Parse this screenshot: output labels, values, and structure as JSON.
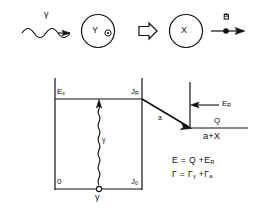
{
  "figure": {
    "title": "",
    "colors": {
      "ink": "#111111",
      "background": "#ffffff"
    }
  },
  "reaction_row": {
    "incoming_photon": {
      "icon": "wavy-arrow-right",
      "label": "γ"
    },
    "compound_nucleus": {
      "icon": "circle-outline",
      "nucleus_label": "Y",
      "orbit_marker": "⊙"
    },
    "transition_arrow": {
      "icon": "double-line-arrow-right",
      "label": ""
    },
    "residual_nucleus": {
      "icon": "circle-outline",
      "nucleus_label": "X"
    },
    "outgoing_particle": {
      "icon": "dot-arrow-right",
      "label": "a"
    }
  },
  "level_diagram": {
    "left_well": {
      "top_level_label": "E",
      "top_level_sub": "x",
      "top_spin_label": "J",
      "top_spin_sub": "R",
      "ground_level_label": "0",
      "ground_spin_label": "J",
      "ground_spin_sub": "0",
      "gamma_transition_label": "γ",
      "gamma_emitter_label": "γ",
      "gamma_icon": "wavy-vertical-arrow-up"
    },
    "right_channel": {
      "resonance_energy_label": "E",
      "resonance_energy_sub": "R",
      "resonance_arrow_icon": "arrow-left",
      "q_value_label": "Q",
      "channel_label": "a+X",
      "alpha_branch_label": "a",
      "decay_arrow_icon": "diagonal-arrow-down-right"
    },
    "equations": [
      {
        "lhs": "E",
        "rel": "=",
        "rhs_terms": [
          "Q",
          "E"
        ],
        "rhs_subs": [
          "",
          "R"
        ],
        "display": "E = Q + E"
      },
      {
        "lhs": "Γ",
        "rel": "=",
        "rhs_terms": [
          "Γ",
          "Γ"
        ],
        "rhs_subs": [
          "γ",
          "a"
        ],
        "display": "Γ = Γ"
      }
    ]
  }
}
